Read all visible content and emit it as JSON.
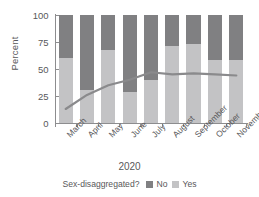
{
  "chart_data": {
    "type": "bar",
    "title": "",
    "subtitle": "",
    "xlabel": "2020",
    "ylabel": "Percent",
    "categories": [
      "March",
      "April",
      "May",
      "June",
      "July",
      "August",
      "September",
      "October",
      "November"
    ],
    "ylim": [
      0,
      100
    ],
    "yticks": [
      0,
      25,
      50,
      75,
      100
    ],
    "ytick_labels": [
      "0",
      "25",
      "50",
      "75",
      "100"
    ],
    "grid": false,
    "stacked": true,
    "legend_position": "bottom",
    "legend_title": "Sex-disaggregated?",
    "series": [
      {
        "name": "No",
        "color": "#808082",
        "values": [
          40,
          69,
          32,
          71,
          60,
          29,
          27,
          42,
          42
        ]
      },
      {
        "name": "Yes",
        "color": "#c3c3c5",
        "values": [
          60,
          31,
          68,
          29,
          40,
          71,
          73,
          58,
          58
        ]
      }
    ],
    "overlay_line": {
      "name": "trend",
      "color": "#8a8a8c",
      "values": [
        13,
        26,
        35,
        40,
        47,
        45,
        46,
        45,
        44
      ]
    }
  },
  "legend": {
    "title": "Sex-disaggregated?",
    "items": [
      {
        "label": "No",
        "color": "#808082"
      },
      {
        "label": "Yes",
        "color": "#c3c3c5"
      }
    ]
  },
  "axis": {
    "y_title": "Percent",
    "x_title": "2020"
  }
}
